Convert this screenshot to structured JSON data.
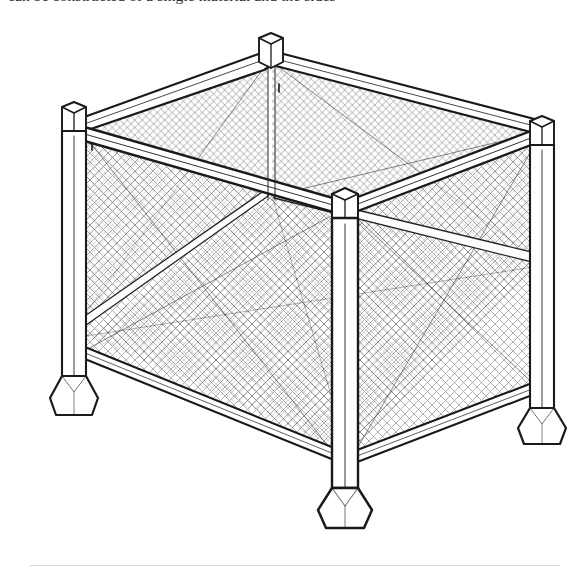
{
  "page": {
    "background_color": "#ffffff",
    "width": 581,
    "height": 576,
    "ink_color": "#1a1a1a",
    "mesh_color": "#4a4a4a",
    "rule_color": "#d9d9dd"
  },
  "top_text": {
    "clipped_line": "can be constructed of a single material and the sides"
  },
  "figure": {
    "view": "isometric perspective line drawing",
    "components": [
      {
        "name": "corner-post-back",
        "label": "rear corner post"
      },
      {
        "name": "corner-post-left",
        "label": "left corner post"
      },
      {
        "name": "corner-post-right",
        "label": "right corner post"
      },
      {
        "name": "corner-post-front",
        "label": "front corner post"
      },
      {
        "name": "top-rail-back-left",
        "label": "top rail back left"
      },
      {
        "name": "top-rail-back-right",
        "label": "top rail back right"
      },
      {
        "name": "top-rail-front-left",
        "label": "top rail front left"
      },
      {
        "name": "top-rail-front-right",
        "label": "top rail front right"
      },
      {
        "name": "bottom-rail-left",
        "label": "bottom rail left"
      },
      {
        "name": "bottom-rail-right",
        "label": "bottom rail right"
      },
      {
        "name": "mesh-panel-back-left",
        "label": "back left mesh panel"
      },
      {
        "name": "mesh-panel-back-right",
        "label": "back right mesh panel"
      },
      {
        "name": "mesh-panel-front-left",
        "label": "front left mesh panel"
      },
      {
        "name": "mesh-panel-front-right",
        "label": "front right mesh panel"
      },
      {
        "name": "mesh-panel-floor",
        "label": "floor mesh panel"
      },
      {
        "name": "foot-left",
        "label": "left flared foot"
      },
      {
        "name": "foot-right",
        "label": "right flared foot"
      },
      {
        "name": "foot-front",
        "label": "front flared foot"
      }
    ]
  },
  "footer": {
    "rule_visible": true
  }
}
